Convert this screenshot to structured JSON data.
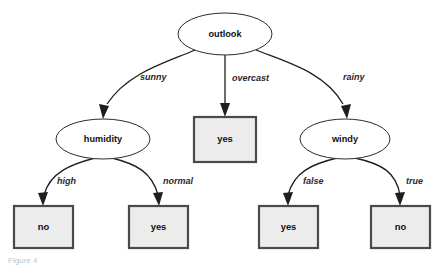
{
  "diagram": {
    "type": "decision-tree",
    "background_color": "#ffffff",
    "decision_node": {
      "fill": "#ffffff",
      "stroke": "#2b2b2b"
    },
    "leaf_node": {
      "fill": "#ececec",
      "stroke": "#4a4a4a"
    },
    "edge_color": "#1e1e1e"
  },
  "nodes": {
    "root": {
      "label": "outlook",
      "shape": "ellipse",
      "cx": 225,
      "cy": 34,
      "rx": 47,
      "ry": 21
    },
    "humidity": {
      "label": "humidity",
      "shape": "ellipse",
      "cx": 103,
      "cy": 139,
      "rx": 47,
      "ry": 20
    },
    "windy": {
      "label": "windy",
      "shape": "ellipse",
      "cx": 345,
      "cy": 139,
      "rx": 45,
      "ry": 20
    },
    "leaf_overcast": {
      "label": "yes",
      "shape": "rect",
      "x": 194,
      "y": 117,
      "w": 62,
      "h": 45
    },
    "leaf_high": {
      "label": "no",
      "shape": "rect",
      "x": 14,
      "y": 206,
      "w": 59,
      "h": 42
    },
    "leaf_normal": {
      "label": "yes",
      "shape": "rect",
      "x": 129,
      "y": 206,
      "w": 59,
      "h": 42
    },
    "leaf_false": {
      "label": "yes",
      "shape": "rect",
      "x": 259,
      "y": 206,
      "w": 59,
      "h": 42
    },
    "leaf_true": {
      "label": "no",
      "shape": "rect",
      "x": 371,
      "y": 206,
      "w": 59,
      "h": 42
    }
  },
  "edges": [
    {
      "id": "sunny",
      "from": "outlook",
      "to": "humidity",
      "label": "sunny",
      "label_x": 140,
      "label_y": 78
    },
    {
      "id": "overcast",
      "from": "outlook",
      "to": "leaf_overcast",
      "label": "overcast",
      "label_x": 232,
      "label_y": 79
    },
    {
      "id": "rainy",
      "from": "outlook",
      "to": "windy",
      "label": "rainy",
      "label_x": 343,
      "label_y": 78
    },
    {
      "id": "high",
      "from": "humidity",
      "to": "leaf_high",
      "label": "high",
      "label_x": 57,
      "label_y": 182
    },
    {
      "id": "normal",
      "from": "humidity",
      "to": "leaf_normal",
      "label": "normal",
      "label_x": 163,
      "label_y": 182
    },
    {
      "id": "false",
      "from": "windy",
      "to": "leaf_false",
      "label": "false",
      "label_x": 303,
      "label_y": 182
    },
    {
      "id": "true",
      "from": "windy",
      "to": "leaf_true",
      "label": "true",
      "label_x": 406,
      "label_y": 182
    }
  ],
  "caption": {
    "text": "Figure 4"
  }
}
